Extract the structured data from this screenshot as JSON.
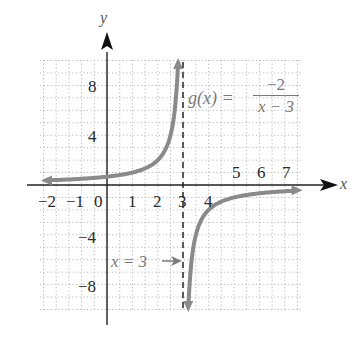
{
  "chart_data": {
    "type": "line",
    "title": "",
    "function_label": {
      "lhs": "g(x) =",
      "numerator": "−2",
      "denominator": "x − 3"
    },
    "xlabel": "x",
    "ylabel": "y",
    "xlim": [
      -2.6,
      7.8
    ],
    "ylim": [
      -10,
      10
    ],
    "grid": true,
    "grid_style": "dotted",
    "x_tick_labels": [
      "−2",
      "−1",
      "0",
      "1",
      "2",
      "3",
      "4",
      "5",
      "6",
      "7"
    ],
    "y_tick_labels": [
      "8",
      "4",
      "−4",
      "−8"
    ],
    "asymptote": {
      "type": "vertical",
      "x": 3,
      "label": "x = 3",
      "style": "dashed"
    },
    "series": [
      {
        "name": "g(x) = -2/(x-3), left branch",
        "x": [
          -2.5,
          -1,
          0,
          1,
          2,
          2.5,
          2.8
        ],
        "y": [
          0.36,
          0.5,
          0.67,
          1,
          2,
          4,
          10
        ]
      },
      {
        "name": "g(x) = -2/(x-3), right branch",
        "x": [
          3.2,
          3.5,
          4,
          5,
          6,
          7,
          7.7
        ],
        "y": [
          -10,
          -4,
          -2,
          -1,
          -0.67,
          -0.5,
          -0.43
        ]
      }
    ],
    "colors": {
      "curve": "#8a8a8a",
      "axes": "#222222",
      "grid": "#b8b8b8",
      "asymptote": "#333333"
    }
  },
  "labels": {
    "x_axis": "x",
    "y_axis": "y",
    "xticks": {
      "m2": "−2",
      "m1": "−1",
      "z": "0",
      "p1": "1",
      "p2": "2",
      "p3": "3",
      "p4": "4",
      "p5": "5",
      "p6": "6",
      "p7": "7"
    },
    "yticks": {
      "p8": "8",
      "p4": "4",
      "m4": "−4",
      "m8": "−8"
    },
    "func_lhs": "g(x) =",
    "func_num": "−2",
    "func_den": "x − 3",
    "asym": "x = 3"
  }
}
